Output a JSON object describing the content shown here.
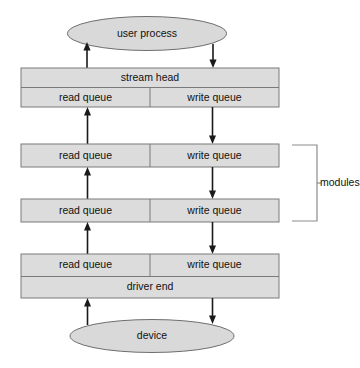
{
  "diagram": {
    "colors": {
      "box_fill": "#dcdcdc",
      "box_stroke": "#7a7a7a",
      "ellipse_fill": "#d9d9d9",
      "ellipse_stroke": "#6e6e6e",
      "arrow": "#1a1a1a",
      "bracket": "#8c8c8c",
      "background": "#ffffff",
      "text": "#111111"
    },
    "nodes": {
      "user_process": "user process",
      "stream_head": "stream head",
      "driver_end": "driver end",
      "device": "device",
      "read_queue": "read queue",
      "write_queue": "write queue"
    },
    "annotations": {
      "modules": "modules"
    },
    "queue_rows": [
      {
        "read": "read queue",
        "write": "write queue"
      },
      {
        "read": "read queue",
        "write": "write queue"
      },
      {
        "read": "read queue",
        "write": "write queue"
      },
      {
        "read": "read queue",
        "write": "write queue"
      }
    ]
  }
}
